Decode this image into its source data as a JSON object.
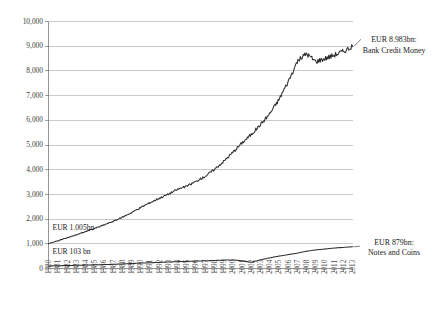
{
  "chart_data": {
    "type": "line",
    "title": "",
    "subtitle": "",
    "xlabel": "",
    "ylabel": "",
    "grid": true,
    "legend_position": "right-inline-annotations",
    "ylim": [
      0,
      10000
    ],
    "yticks": [
      "0",
      "1,000",
      "2,000",
      "3,000",
      "4,000",
      "5,000",
      "6,000",
      "7,000",
      "8,000",
      "9,000",
      "10,000"
    ],
    "ytick_values": [
      0,
      1000,
      2000,
      3000,
      4000,
      5000,
      6000,
      7000,
      8000,
      9000,
      10000
    ],
    "xlim": [
      1980,
      2013
    ],
    "categories": [
      "1980",
      "1981",
      "1982",
      "1983",
      "1984",
      "1985",
      "1986",
      "1987",
      "1988",
      "1989",
      "1990",
      "1991",
      "1992",
      "1993",
      "1994",
      "1995",
      "1996",
      "1997",
      "1998",
      "1999",
      "2000",
      "2001",
      "2002",
      "2003",
      "2004",
      "2005",
      "2006",
      "2007",
      "2008",
      "2009",
      "2010",
      "2011",
      "2012",
      "2013"
    ],
    "x": [
      1980,
      1981,
      1982,
      1983,
      1984,
      1985,
      1986,
      1987,
      1988,
      1989,
      1990,
      1991,
      1992,
      1993,
      1994,
      1995,
      1996,
      1997,
      1998,
      1999,
      2000,
      2001,
      2002,
      2003,
      2004,
      2005,
      2006,
      2007,
      2008,
      2009,
      2010,
      2011,
      2012,
      2013
    ],
    "series": [
      {
        "name": "Bank Credit Money",
        "units": "EUR bn",
        "values": [
          1005,
          1120,
          1240,
          1360,
          1490,
          1620,
          1760,
          1905,
          2070,
          2260,
          2470,
          2660,
          2840,
          3010,
          3200,
          3330,
          3520,
          3730,
          4010,
          4330,
          4700,
          5080,
          5420,
          5820,
          6260,
          6830,
          7550,
          8380,
          8700,
          8380,
          8500,
          8640,
          8790,
          8983
        ]
      },
      {
        "name": "Notes and Coins",
        "units": "EUR bn",
        "values": [
          103,
          112,
          120,
          129,
          138,
          147,
          158,
          170,
          184,
          200,
          218,
          232,
          247,
          262,
          275,
          288,
          300,
          312,
          325,
          340,
          348,
          315,
          250,
          350,
          430,
          500,
          560,
          620,
          700,
          750,
          790,
          825,
          855,
          879
        ]
      }
    ],
    "annotations": [
      {
        "name": "start-bank-credit",
        "text": "EUR 1.005bn",
        "series": "Bank Credit Money",
        "at_year": 1980,
        "value": 1005
      },
      {
        "name": "start-notes-coins",
        "text": "EUR 103 bn",
        "series": "Notes and Coins",
        "at_year": 1980,
        "value": 103
      },
      {
        "name": "end-bank-credit",
        "line1": "EUR 8.983bn:",
        "line2": "Bank Credit Money",
        "series": "Bank Credit Money",
        "at_year": 2013,
        "value": 8983
      },
      {
        "name": "end-notes-coins",
        "line1": "EUR 879bn:",
        "line2": "Notes and Coins",
        "series": "Notes and Coins",
        "at_year": 2013,
        "value": 879
      }
    ],
    "colors": {
      "line": "#2e2e2e",
      "grid": "#b4b4b4",
      "axis": "#7a7a7a",
      "background": "#ffffff",
      "text": "#1a1a1a"
    }
  }
}
